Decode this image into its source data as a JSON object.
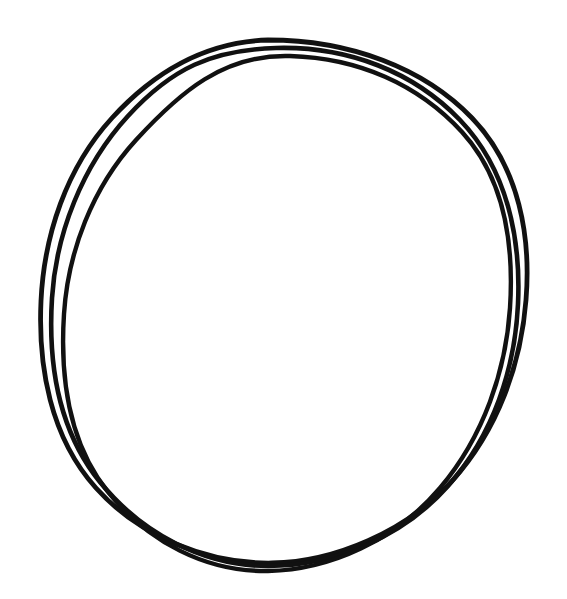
{
  "canvas": {
    "width": 567,
    "height": 599,
    "background_color": "#ffffff",
    "title": "Hand-drawn circle sketch"
  },
  "drawing": {
    "subject": "circle",
    "style": "freehand ink sketch",
    "stroke_count": 3,
    "ink_color": "#111111",
    "stroke_width": 4.6,
    "bounds": {
      "x_min": 38,
      "y_min": 38,
      "x_max": 528,
      "y_max": 565
    },
    "center": {
      "x": 283,
      "y": 300
    },
    "radius_x": 245,
    "radius_y": 263,
    "strokes": [
      {
        "name": "outer-pass",
        "stroke_width": 4.8,
        "opacity": 1,
        "path": "M 268 40 C 350 40 424 68 472 118 C 520 168 531 238 526 300 C 521 364 498 430 452 481 C 406 532 334 562 272 563 C 208 564 140 537 96 488 C 50 437 38 366 41 301 C 44 236 66 168 112 118 C 156 70 206 42 268 40 Z"
      },
      {
        "name": "second-pass",
        "stroke_width": 4.6,
        "opacity": 1,
        "path": "M 276 48 C 348 46 414 72 460 120 C 508 170 521 240 518 304 C 515 368 494 434 448 486 C 402 538 332 566 268 566 C 204 566 142 534 100 482 C 58 430 48 362 52 298 C 56 234 82 166 128 116 C 172 68 212 50 276 48 Z"
      },
      {
        "name": "third-pass",
        "stroke_width": 4.4,
        "opacity": 1,
        "path": "M 290 56 C 358 58 418 84 462 132 C 506 180 514 246 510 308 C 506 370 484 436 440 488 C 396 540 330 570 268 571 C 206 572 148 542 108 492 C 68 442 60 376 64 314 C 68 252 92 188 136 140 C 180 92 224 54 290 56 Z"
      }
    ]
  }
}
